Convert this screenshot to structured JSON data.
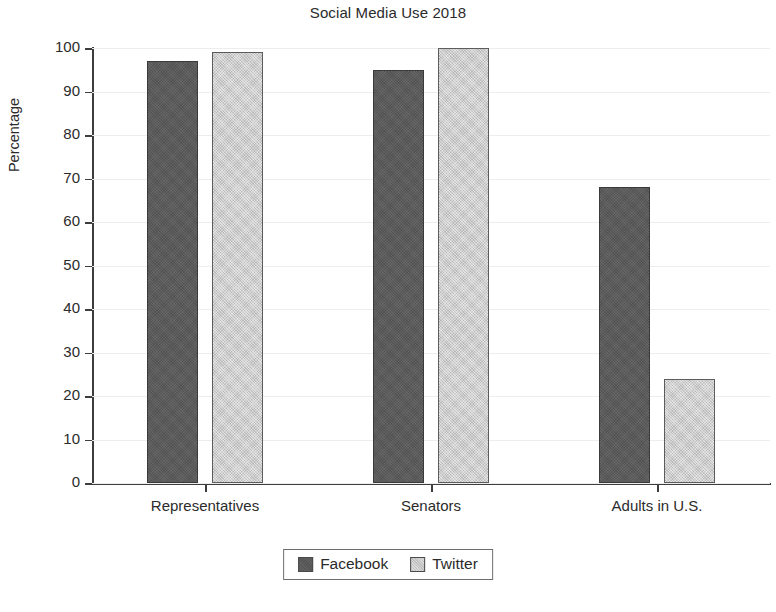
{
  "chart_data": {
    "type": "bar",
    "title": "Social Media Use 2018",
    "xlabel": "",
    "ylabel": "Percentage",
    "ylim": [
      0,
      100
    ],
    "yticks": [
      0,
      10,
      20,
      30,
      40,
      50,
      60,
      70,
      80,
      90,
      100
    ],
    "grid": true,
    "legend_position": "bottom-center",
    "categories": [
      "Representatives",
      "Senators",
      "Adults in U.S."
    ],
    "series": [
      {
        "name": "Facebook",
        "color": "#595959",
        "values": [
          97,
          95,
          68
        ]
      },
      {
        "name": "Twitter",
        "color": "#cacaca",
        "values": [
          99,
          100,
          24
        ]
      }
    ]
  },
  "legend": {
    "items": [
      {
        "label": "Facebook"
      },
      {
        "label": "Twitter"
      }
    ]
  }
}
